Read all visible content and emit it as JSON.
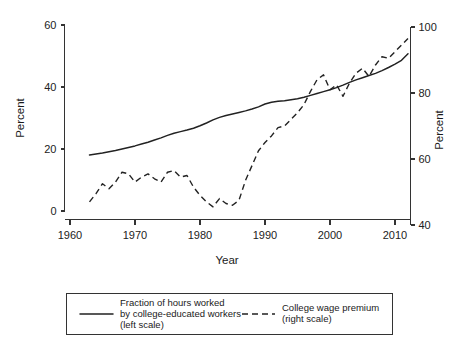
{
  "chart_data": {
    "type": "line",
    "title": "",
    "xlabel": "Year",
    "ylabel": "Percent",
    "ylabel_right": "Percent",
    "xlim": [
      1958,
      2014
    ],
    "ylim": [
      0,
      62
    ],
    "ylim_right": [
      38,
      102
    ],
    "grid": false,
    "legend_position": "below",
    "xticks": [
      1960,
      1970,
      1980,
      1990,
      2000,
      2010
    ],
    "xticklabels": [
      "1960",
      "1970",
      "1980",
      "1990",
      "2000",
      "2010"
    ],
    "yticks": [
      0,
      20,
      40,
      60
    ],
    "yticklabels": [
      "0",
      "20",
      "40",
      "60"
    ],
    "yticks_right": [
      40,
      60,
      80,
      100
    ],
    "yticklabels_right": [
      "40",
      "60",
      "80",
      "100"
    ],
    "series": [
      {
        "name": "Fraction of hours worked by college-educated workers (left scale)",
        "axis": "left",
        "style": "solid",
        "color": "#222222",
        "x": [
          1963,
          1964,
          1965,
          1966,
          1967,
          1968,
          1969,
          1970,
          1971,
          1972,
          1973,
          1974,
          1975,
          1976,
          1977,
          1978,
          1979,
          1980,
          1981,
          1982,
          1983,
          1984,
          1985,
          1986,
          1987,
          1988,
          1989,
          1990,
          1991,
          1992,
          1993,
          1994,
          1995,
          1996,
          1997,
          1998,
          1999,
          2000,
          2001,
          2002,
          2003,
          2004,
          2005,
          2006,
          2007,
          2008,
          2009,
          2010,
          2011,
          2012
        ],
        "values": [
          18.1,
          18.4,
          18.7,
          19.1,
          19.5,
          20.0,
          20.5,
          21.0,
          21.6,
          22.2,
          22.9,
          23.6,
          24.4,
          25.1,
          25.6,
          26.1,
          26.7,
          27.5,
          28.4,
          29.4,
          30.2,
          30.8,
          31.3,
          31.8,
          32.3,
          32.9,
          33.6,
          34.5,
          35.1,
          35.4,
          35.6,
          35.9,
          36.2,
          36.7,
          37.3,
          37.9,
          38.5,
          39.1,
          39.8,
          40.6,
          41.5,
          42.3,
          43.0,
          43.7,
          44.4,
          45.3,
          46.3,
          47.4,
          48.6,
          50.7
        ]
      },
      {
        "name": "College wage premium (right scale)",
        "axis": "right",
        "style": "dashed",
        "color": "#222222",
        "x": [
          1963,
          1964,
          1965,
          1966,
          1967,
          1968,
          1969,
          1970,
          1971,
          1972,
          1973,
          1974,
          1975,
          1976,
          1977,
          1978,
          1979,
          1980,
          1981,
          1982,
          1983,
          1984,
          1985,
          1986,
          1987,
          1988,
          1989,
          1990,
          1991,
          1992,
          1993,
          1994,
          1995,
          1996,
          1997,
          1998,
          1999,
          2000,
          2001,
          2002,
          2003,
          2004,
          2005,
          2006,
          2007,
          2008,
          2009,
          2010,
          2011,
          2012
        ],
        "values": [
          47.0,
          49.5,
          52.5,
          51.0,
          53.0,
          56.0,
          55.5,
          53.0,
          54.5,
          55.5,
          54.0,
          53.0,
          56.0,
          56.5,
          54.5,
          55.0,
          51.5,
          49.0,
          47.0,
          45.5,
          48.0,
          46.5,
          46.0,
          47.5,
          53.5,
          58.0,
          62.5,
          65.0,
          67.0,
          69.5,
          70.0,
          72.0,
          74.0,
          76.5,
          80.5,
          84.0,
          85.5,
          81.0,
          82.5,
          79.0,
          83.0,
          86.0,
          87.5,
          85.0,
          88.5,
          91.0,
          90.5,
          92.5,
          94.5,
          96.5
        ]
      }
    ]
  },
  "legend": {
    "entries": [
      {
        "style": "solid",
        "line1": "Fraction of hours worked",
        "line2": "by college-educated workers",
        "line3": "(left scale)"
      },
      {
        "style": "dashed",
        "line1": "College wage premium",
        "line2": "(right scale)",
        "line3": ""
      }
    ]
  }
}
